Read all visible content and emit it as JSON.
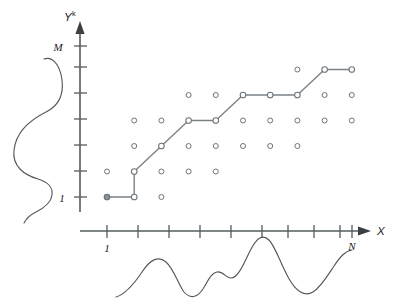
{
  "figure": {
    "title": "",
    "axes": {
      "x": {
        "label": "X",
        "origin_tick_label": "1",
        "end_tick_label": "N",
        "n_ticks": 10
      },
      "y": {
        "label": "Y",
        "label_superscript": "k",
        "origin_tick_label": "1",
        "end_tick_label": "M",
        "n_ticks": 7
      }
    },
    "colors": {
      "axis": "#555b5f",
      "dot_stroke": "#6e7478",
      "path": "#7b8286",
      "curve": "#55595c",
      "text": "#1d2124",
      "background": "#ffffff"
    }
  },
  "chart_data": {
    "type": "scatter",
    "title": "",
    "xlabel": "X",
    "ylabel": "Y^k",
    "grid": false,
    "legend": "none",
    "xlim": [
      1,
      10
    ],
    "ylim": [
      1,
      7
    ],
    "xtick_labels": [
      "1",
      "",
      "",
      "",
      "",
      "",
      "",
      "",
      "",
      "N"
    ],
    "ytick_labels": [
      "1",
      "",
      "",
      "",
      "",
      "",
      "M"
    ],
    "grid_points": [
      {
        "x": 1,
        "y": 1
      },
      {
        "x": 2,
        "y": 1
      },
      {
        "x": 3,
        "y": 1
      },
      {
        "x": 1,
        "y": 2
      },
      {
        "x": 2,
        "y": 2
      },
      {
        "x": 3,
        "y": 2
      },
      {
        "x": 4,
        "y": 2
      },
      {
        "x": 5,
        "y": 2
      },
      {
        "x": 2,
        "y": 3
      },
      {
        "x": 3,
        "y": 3
      },
      {
        "x": 4,
        "y": 3
      },
      {
        "x": 5,
        "y": 3
      },
      {
        "x": 6,
        "y": 3
      },
      {
        "x": 7,
        "y": 3
      },
      {
        "x": 8,
        "y": 3
      },
      {
        "x": 2,
        "y": 4
      },
      {
        "x": 3,
        "y": 4
      },
      {
        "x": 4,
        "y": 4
      },
      {
        "x": 5,
        "y": 4
      },
      {
        "x": 6,
        "y": 4
      },
      {
        "x": 7,
        "y": 4
      },
      {
        "x": 8,
        "y": 4
      },
      {
        "x": 9,
        "y": 4
      },
      {
        "x": 10,
        "y": 4
      },
      {
        "x": 4,
        "y": 5
      },
      {
        "x": 5,
        "y": 5
      },
      {
        "x": 6,
        "y": 5
      },
      {
        "x": 7,
        "y": 5
      },
      {
        "x": 8,
        "y": 5
      },
      {
        "x": 9,
        "y": 5
      },
      {
        "x": 10,
        "y": 5
      },
      {
        "x": 8,
        "y": 6
      },
      {
        "x": 9,
        "y": 6
      },
      {
        "x": 10,
        "y": 6
      }
    ],
    "path_points": [
      {
        "x": 1,
        "y": 1
      },
      {
        "x": 2,
        "y": 1
      },
      {
        "x": 2,
        "y": 2
      },
      {
        "x": 3,
        "y": 3
      },
      {
        "x": 4,
        "y": 4
      },
      {
        "x": 5,
        "y": 4
      },
      {
        "x": 6,
        "y": 5
      },
      {
        "x": 7,
        "y": 5
      },
      {
        "x": 8,
        "y": 5
      },
      {
        "x": 9,
        "y": 6
      },
      {
        "x": 10,
        "y": 6
      }
    ],
    "marginal_left": {
      "name": "Y marginal density",
      "orientation": "vertical",
      "note": "multi-modal density drawn to the left of the Y axis"
    },
    "marginal_bottom": {
      "name": "X marginal density",
      "orientation": "horizontal",
      "note": "multi-modal density drawn below the X axis"
    }
  }
}
